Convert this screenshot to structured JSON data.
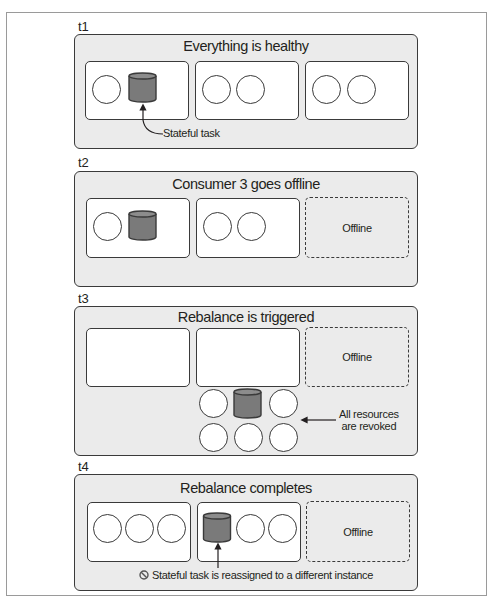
{
  "colors": {
    "panel_fill": "#ebebeb",
    "border": "#3a3a3a",
    "stateful_task_fill": "#7a7a7a",
    "box_fill": "#ffffff"
  },
  "stages": [
    {
      "label": "t1",
      "title": "Everything is healthy",
      "consumers": [
        {
          "state": "online",
          "items": [
            "task",
            "stateful-task"
          ]
        },
        {
          "state": "online",
          "items": [
            "task",
            "task"
          ]
        },
        {
          "state": "online",
          "items": [
            "task",
            "task"
          ]
        }
      ],
      "annotation": "Stateful task"
    },
    {
      "label": "t2",
      "title": "Consumer 3 goes offline",
      "consumers": [
        {
          "state": "online",
          "items": [
            "task",
            "stateful-task"
          ]
        },
        {
          "state": "online",
          "items": [
            "task",
            "task"
          ]
        },
        {
          "state": "offline",
          "label": "Offline"
        }
      ]
    },
    {
      "label": "t3",
      "title": "Rebalance is triggered",
      "consumers": [
        {
          "state": "online",
          "items": []
        },
        {
          "state": "online",
          "items": []
        },
        {
          "state": "offline",
          "label": "Offline"
        }
      ],
      "revoked_pool": [
        "task",
        "stateful-task",
        "task",
        "task",
        "task",
        "task"
      ],
      "annotation_line1": "All resources",
      "annotation_line2": "are revoked"
    },
    {
      "label": "t4",
      "title": "Rebalance completes",
      "consumers": [
        {
          "state": "online",
          "items": [
            "task",
            "task",
            "task"
          ]
        },
        {
          "state": "online",
          "items": [
            "stateful-task",
            "task",
            "task"
          ]
        },
        {
          "state": "offline",
          "label": "Offline"
        }
      ],
      "annotation": "Stateful task is reassigned to a different instance",
      "annotation_icon": "prohibited-icon"
    }
  ]
}
